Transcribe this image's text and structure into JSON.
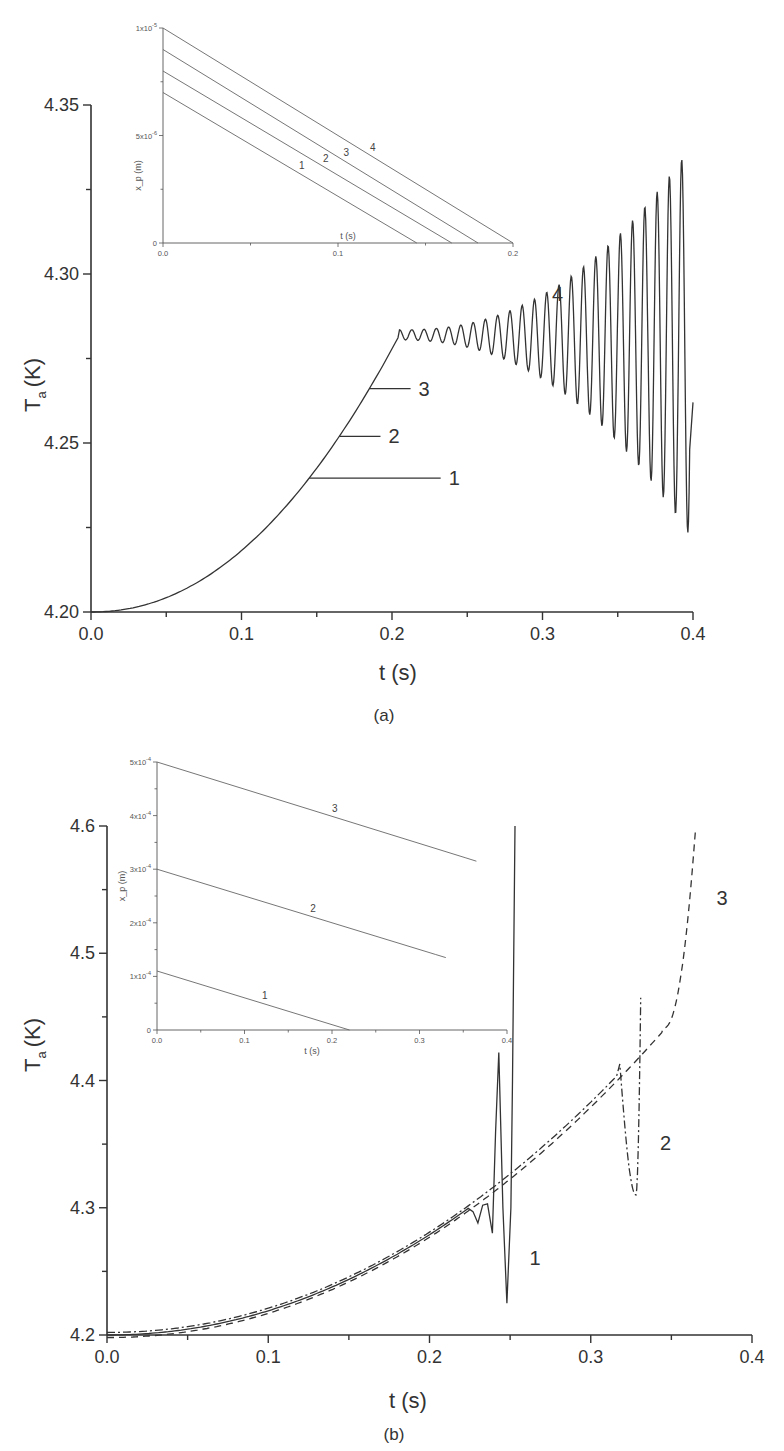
{
  "chart_data": [
    {
      "panel": "(a)",
      "type": "line",
      "xlabel": "t (s)",
      "ylabel_main": "T",
      "ylabel_sub": "a",
      "ylabel_unit": "(K)",
      "xlim": [
        0.0,
        0.4
      ],
      "ylim": [
        4.2,
        4.35
      ],
      "xticks": [
        "0.0",
        "0.1",
        "0.2",
        "0.3",
        "0.4"
      ],
      "yticks": [
        "4.20",
        "4.25",
        "4.30",
        "4.35"
      ],
      "series": [
        {
          "name": "1",
          "t_end": 0.145,
          "T_end": 4.24,
          "label_at": [
            0.235,
            4.24
          ]
        },
        {
          "name": "2",
          "t_end": 0.165,
          "T_end": 4.252,
          "label_at": [
            0.195,
            4.252
          ]
        },
        {
          "name": "3",
          "t_end": 0.185,
          "T_end": 4.266,
          "label_at": [
            0.215,
            4.266
          ]
        },
        {
          "name": "4",
          "t_end": 0.4,
          "T_end": 4.262,
          "plateau_T": 4.282,
          "plateau_start_t": 0.205,
          "max_T": 4.35,
          "min_T": 4.238,
          "label_at": [
            0.31,
            4.292
          ]
        }
      ],
      "inset": {
        "xlabel": "t (s)",
        "ylabel": "x_p (m)",
        "xlim": [
          0.0,
          0.2
        ],
        "ylim": [
          0,
          1e-05
        ],
        "xticks": [
          "0.0",
          "0.1",
          "0.2"
        ],
        "yticks": [
          "0",
          "5x10^-6",
          "1x10^-5"
        ],
        "ytick_labels": [
          "0",
          "5x10",
          "1x10"
        ],
        "ytick_exps": [
          "",
          "-6",
          "-5"
        ],
        "lines": [
          {
            "name": "1",
            "x0": 7e-06,
            "t_zero": 0.145
          },
          {
            "name": "2",
            "x0": 8e-06,
            "t_zero": 0.165
          },
          {
            "name": "3",
            "x0": 9e-06,
            "t_zero": 0.18
          },
          {
            "name": "4",
            "x0": 1e-05,
            "t_zero": 0.2
          }
        ]
      }
    },
    {
      "panel": "(b)",
      "type": "line",
      "xlabel": "t (s)",
      "ylabel_main": "T",
      "ylabel_sub": "a",
      "ylabel_unit": "(K)",
      "xlim": [
        0.0,
        0.4
      ],
      "ylim": [
        4.2,
        4.6
      ],
      "xticks": [
        "0.0",
        "0.1",
        "0.2",
        "0.3",
        "0.4"
      ],
      "yticks": [
        "4.2",
        "4.3",
        "4.4",
        "4.5",
        "4.6"
      ],
      "series": [
        {
          "name": "1",
          "style": "solid",
          "peak_t": 0.243,
          "peak_T": 4.422,
          "min_t": 0.248,
          "min_T": 4.225,
          "end_t": 0.253,
          "end_T": 4.6,
          "label_at": [
            0.262,
            4.255
          ]
        },
        {
          "name": "2",
          "style": "dash-dot",
          "peak_t": 0.318,
          "peak_T": 4.413,
          "min_t": 0.328,
          "min_T": 4.31,
          "end_t": 0.331,
          "end_T": 4.465,
          "label_at": [
            0.343,
            4.345
          ]
        },
        {
          "name": "3",
          "style": "dashed",
          "end_t": 0.365,
          "end_T": 4.598,
          "label_at": [
            0.378,
            4.538
          ]
        }
      ],
      "inset": {
        "xlabel": "t (s)",
        "ylabel": "x_p (m)",
        "xlim": [
          0.0,
          0.4
        ],
        "ylim": [
          0,
          0.0005
        ],
        "xticks": [
          "0.0",
          "0.1",
          "0.2",
          "0.3",
          "0.4"
        ],
        "yticks": [
          "0",
          "1x10^-4",
          "2x10^-4",
          "3x10^-4",
          "4x10^-4",
          "5x10^-4"
        ],
        "ytick_labels": [
          "0",
          "1x10",
          "2x10",
          "3x10",
          "4x10",
          "5x10"
        ],
        "ytick_exps": [
          "",
          "-4",
          "-4",
          "-4",
          "-4",
          "-4"
        ],
        "lines": [
          {
            "name": "1",
            "x0": 0.00011,
            "t_end": 0.22,
            "x_end": 0.0
          },
          {
            "name": "2",
            "x0": 0.0003,
            "t_end": 0.33,
            "x_end": 0.000135
          },
          {
            "name": "3",
            "x0": 0.0005,
            "t_end": 0.365,
            "x_end": 0.000315
          }
        ]
      }
    }
  ],
  "captions": {
    "a": "(a)",
    "b": "(b)"
  }
}
